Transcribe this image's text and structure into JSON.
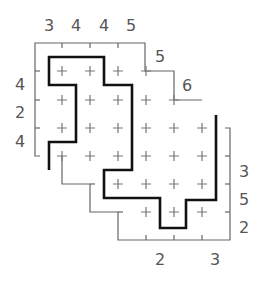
{
  "puzzle": {
    "type": "staircase-skyscraper-path",
    "colors": {
      "thin_line": "#666666",
      "thick_line": "#111111",
      "cross": "#777777",
      "clue": "#555555",
      "background": "#ffffff"
    },
    "top_clues": [
      {
        "label": "3",
        "x": 49,
        "y": 26
      },
      {
        "label": "4",
        "x": 76,
        "y": 26
      },
      {
        "label": "4",
        "x": 104,
        "y": 26
      },
      {
        "label": "5",
        "x": 131,
        "y": 26
      }
    ],
    "step_clues": [
      {
        "label": "5",
        "x": 160,
        "y": 57
      },
      {
        "label": "6",
        "x": 187,
        "y": 86
      }
    ],
    "left_clues": [
      {
        "label": "4",
        "x": 20,
        "y": 85
      },
      {
        "label": "2",
        "x": 20,
        "y": 113
      },
      {
        "label": "4",
        "x": 20,
        "y": 142
      }
    ],
    "right_clues": [
      {
        "label": "3",
        "x": 244,
        "y": 172
      },
      {
        "label": "5",
        "x": 244,
        "y": 200
      },
      {
        "label": "2",
        "x": 244,
        "y": 228
      }
    ],
    "bottom_clues": [
      {
        "label": "2",
        "x": 160,
        "y": 260
      },
      {
        "label": "3",
        "x": 215,
        "y": 260
      }
    ]
  }
}
